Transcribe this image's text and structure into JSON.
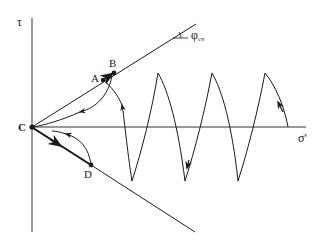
{
  "diagram": {
    "colors": {
      "line": "#1a1a1a",
      "axis": "#333333",
      "background": "#ffffff"
    },
    "axes": {
      "y_label": "τ",
      "x_label": "σ'"
    },
    "envelope": {
      "angle_label": "φ",
      "angle_subscript": "cv"
    },
    "points": {
      "A": "A",
      "B": "B",
      "C": "C",
      "D": "D"
    },
    "cycles": {
      "peaks_x": [
        158,
        212,
        265
      ],
      "valleys_x": [
        132,
        185,
        238
      ],
      "peak_y": 73,
      "valley_y": 181
    }
  }
}
